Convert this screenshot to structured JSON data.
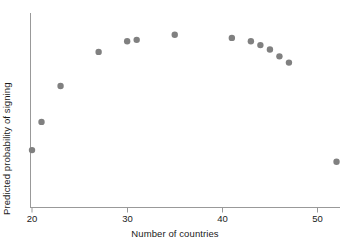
{
  "chart_data": {
    "type": "scatter",
    "title": "",
    "xlabel": "Number of countries",
    "ylabel": "Predicted probability of signing",
    "xlim": [
      18.5,
      53.5
    ],
    "ylim": [
      0,
      1
    ],
    "grid": false,
    "legend": null,
    "xticks": [
      "20",
      "30",
      "40",
      "50"
    ],
    "xtick_values": [
      20,
      30,
      40,
      50
    ],
    "yticks": [],
    "marker": {
      "shape": "circle",
      "color": "#808080",
      "size": 3.2
    },
    "x": [
      20,
      21,
      23,
      27,
      30,
      31,
      35,
      41,
      43,
      44,
      45,
      46,
      47,
      52
    ],
    "y": [
      0.295,
      0.44,
      0.625,
      0.8,
      0.855,
      0.862,
      0.888,
      0.872,
      0.855,
      0.835,
      0.812,
      0.777,
      0.745,
      0.235
    ],
    "points": [
      {
        "x": 20,
        "y": 0.295
      },
      {
        "x": 21,
        "y": 0.44
      },
      {
        "x": 23,
        "y": 0.625
      },
      {
        "x": 27,
        "y": 0.8
      },
      {
        "x": 30,
        "y": 0.855
      },
      {
        "x": 31,
        "y": 0.862
      },
      {
        "x": 35,
        "y": 0.888
      },
      {
        "x": 41,
        "y": 0.872
      },
      {
        "x": 43,
        "y": 0.855
      },
      {
        "x": 44,
        "y": 0.835
      },
      {
        "x": 45,
        "y": 0.812
      },
      {
        "x": 46,
        "y": 0.777
      },
      {
        "x": 47,
        "y": 0.745
      },
      {
        "x": 52,
        "y": 0.235
      }
    ]
  },
  "axes": {
    "xlabel": "Number of countries",
    "ylabel": "Predicted probability of signing",
    "spine_color": "#999999",
    "tick_color": "#999999"
  }
}
